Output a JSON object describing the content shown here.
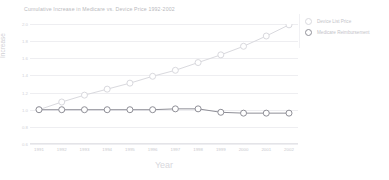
{
  "chart_data": {
    "type": "line",
    "title": "Cumulative Increase in Medicare vs. Device Price 1992-2002",
    "xlabel": "Year",
    "ylabel": "Increase",
    "x": [
      "1991",
      "1992",
      "1993",
      "1994",
      "1995",
      "1996",
      "1997",
      "1998",
      "1999",
      "2000",
      "2001",
      "2002"
    ],
    "categories": [
      "1991",
      "1992",
      "1993",
      "1994",
      "1995",
      "1996",
      "1997",
      "1998",
      "1999",
      "2000",
      "2001",
      "2002"
    ],
    "yticks": [
      "2.0",
      "1.8",
      "1.6",
      "1.4",
      "1.2",
      "1.0",
      "0.8",
      "0.6"
    ],
    "ylim": [
      0.6,
      2.0
    ],
    "grid": true,
    "legend_position": "right",
    "series": [
      {
        "name": "Device List Price",
        "color": "#d9d9de",
        "marker": "open-circle",
        "values": [
          1.0,
          1.09,
          1.17,
          1.24,
          1.31,
          1.39,
          1.46,
          1.55,
          1.64,
          1.74,
          1.86,
          1.99
        ]
      },
      {
        "name": "Medicare Reimbursement",
        "color": "#8f8f97",
        "marker": "open-circle",
        "values": [
          1.0,
          1.0,
          1.0,
          1.0,
          1.0,
          1.0,
          1.01,
          1.01,
          0.97,
          0.96,
          0.96,
          0.96
        ]
      }
    ]
  },
  "legend": {
    "items": [
      {
        "label": "Device List Price"
      },
      {
        "label": "Medicare Reimbursement"
      }
    ]
  }
}
